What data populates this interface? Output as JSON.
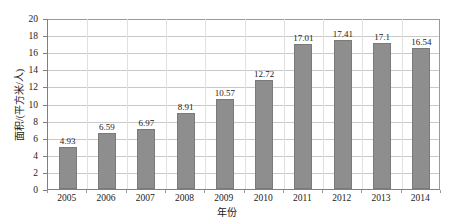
{
  "chart_data": {
    "type": "bar",
    "title": "",
    "xlabel": "年份",
    "ylabel": "面积/(平方米/人)",
    "categories": [
      "2005",
      "2006",
      "2007",
      "2008",
      "2009",
      "2010",
      "2011",
      "2012",
      "2013",
      "2014"
    ],
    "values": [
      4.93,
      6.59,
      6.97,
      8.91,
      10.57,
      12.72,
      17.01,
      17.41,
      17.1,
      16.54
    ],
    "value_labels": [
      "4.93",
      "6.59",
      "6.97",
      "8.91",
      "10.57",
      "12.72",
      "17.01",
      "17.41",
      "17.1",
      "16.54"
    ],
    "ylim": [
      0,
      20
    ],
    "ytick_values": [
      0,
      2,
      4,
      6,
      8,
      10,
      12,
      14,
      16,
      18,
      20
    ],
    "ytick_labels": [
      "0",
      "2",
      "4",
      "6",
      "8",
      "10",
      "12",
      "14",
      "16",
      "18",
      "20"
    ],
    "grid": "horizontal",
    "legend": "none",
    "bar_color": "#8e8e8e",
    "bar_border_color": "#7a7a7a",
    "gridline_color": "#c9c9c9",
    "axis_color": "#808080",
    "background": "#ffffff"
  }
}
